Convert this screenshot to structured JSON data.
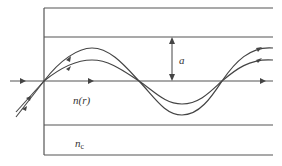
{
  "diagram": {
    "colors": {
      "line": "#555555",
      "ray": "#444444",
      "text": "#333333",
      "background": "#ffffff"
    },
    "labels": {
      "core_radius": "a",
      "core_index": "n(r)",
      "cladding_index_base": "n",
      "cladding_index_sub": "c"
    },
    "elements": {
      "boundaries": [
        "outer-top",
        "core-cladding-top",
        "axis",
        "core-cladding-bottom",
        "outer-bottom"
      ],
      "rays": [
        "axial-ray",
        "meridional-ray-outer",
        "meridional-ray-inner"
      ],
      "dimension_arrow": "core radius a"
    }
  }
}
